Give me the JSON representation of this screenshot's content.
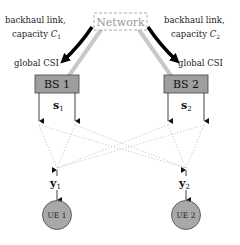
{
  "network": {
    "label": "Network"
  },
  "backhaul": [
    {
      "line1": "backhaul link,",
      "line2": "capacity ",
      "capacity_symbol": "C",
      "capacity_sub": "1",
      "csi": "global CSI"
    },
    {
      "line1": "backhaul link,",
      "line2": "capacity ",
      "capacity_symbol": "C",
      "capacity_sub": "2",
      "csi": "global CSI"
    }
  ],
  "base_stations": [
    {
      "label": "BS 1",
      "signal": "s",
      "signal_sub": "1"
    },
    {
      "label": "BS 2",
      "signal": "s",
      "signal_sub": "2"
    }
  ],
  "users": [
    {
      "label": "UE 1",
      "received": "y",
      "received_sub": "1"
    },
    {
      "label": "UE 2",
      "received": "y",
      "received_sub": "2"
    }
  ],
  "colors": {
    "bs_fill": "#9e9e9e",
    "ue_fill": "#a8a8a8",
    "backhaul_line": "#c8c8c8",
    "arrow": "#000000",
    "channel_dots": "#c0c0c0",
    "network_border": "#999999"
  }
}
